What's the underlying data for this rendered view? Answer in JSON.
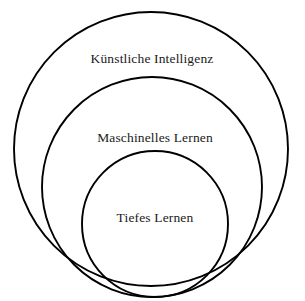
{
  "diagram": {
    "type": "euler-nested-circles",
    "background_color": "#ffffff",
    "stroke_color": "#000000",
    "text_color": "#1a1a1a",
    "language": "de",
    "rings": [
      {
        "id": "ai",
        "label": "Künstliche Intelligenz",
        "level": 1,
        "fill_color": "#ffffff",
        "cx": 151,
        "cy": 149,
        "r": 137,
        "label_x": 152,
        "label_y": 63
      },
      {
        "id": "ml",
        "label": "Maschinelles Lernen",
        "level": 2,
        "fill_color": "#f2f2f2",
        "cx": 152,
        "cy": 187,
        "r": 110,
        "label_x": 155,
        "label_y": 142
      },
      {
        "id": "dl",
        "label": "Tiefes Lernen",
        "level": 3,
        "fill_color": "#c4c4c4",
        "cx": 155,
        "cy": 224,
        "r": 73,
        "label_x": 155,
        "label_y": 222
      }
    ]
  }
}
